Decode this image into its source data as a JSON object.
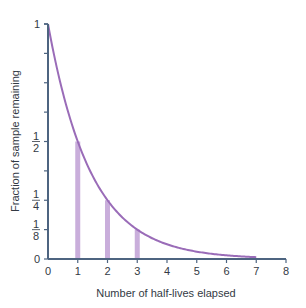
{
  "chart_data": {
    "type": "line",
    "title": "",
    "xlabel": "Number of half-lives elapsed",
    "ylabel": "Fraction of sample remaining",
    "xlim": [
      0,
      8
    ],
    "ylim": [
      0,
      1
    ],
    "x_ticks": [
      "0",
      "1",
      "2",
      "3",
      "4",
      "5",
      "6",
      "7",
      "8"
    ],
    "y_ticks": [
      {
        "value": 0,
        "label": "0"
      },
      {
        "value": 0.125,
        "label": "1/8"
      },
      {
        "value": 0.25,
        "label": "1/4"
      },
      {
        "value": 0.375,
        "label": ""
      },
      {
        "value": 0.5,
        "label": "1/2"
      },
      {
        "value": 0.625,
        "label": ""
      },
      {
        "value": 0.75,
        "label": ""
      },
      {
        "value": 0.875,
        "label": ""
      },
      {
        "value": 1,
        "label": "1"
      }
    ],
    "grid": false,
    "series": [
      {
        "name": "Exponential decay curve",
        "type": "line",
        "x": [
          0,
          1,
          2,
          3,
          4,
          5,
          6,
          7
        ],
        "values": [
          1,
          0.5,
          0.25,
          0.125,
          0.0625,
          0.03125,
          0.015625,
          0.0078125
        ]
      },
      {
        "name": "Half-life markers",
        "type": "bar",
        "x": [
          1,
          2,
          3
        ],
        "values": [
          0.5,
          0.25,
          0.125
        ]
      }
    ]
  },
  "colors": {
    "curve": "#9a6cb8",
    "bars": "#c9aedb",
    "axis": "#4d6480",
    "text": "#333a44"
  }
}
